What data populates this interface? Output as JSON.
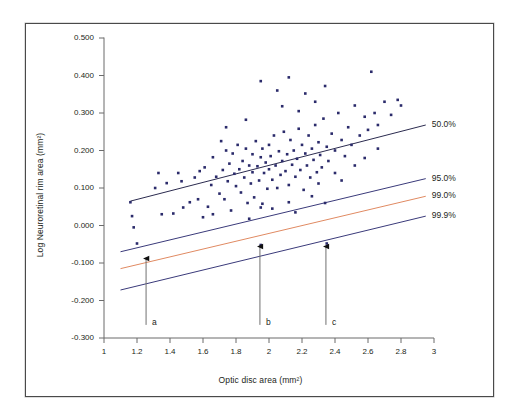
{
  "chart_data": {
    "type": "scatter",
    "title": "",
    "xlabel": "Optic disc area (mm²)",
    "ylabel": "Log Neuroretinal rim area (mm²)",
    "xlim": [
      1,
      3
    ],
    "ylim": [
      -0.3,
      0.5
    ],
    "xticks": [
      "1",
      "1.2",
      "1.4",
      "1.6",
      "1.8",
      "2",
      "2.2",
      "2.4",
      "2.6",
      "2.8",
      "3"
    ],
    "xtick_values": [
      1,
      1.2,
      1.4,
      1.6,
      1.8,
      2,
      2.2,
      2.4,
      2.6,
      2.8,
      3
    ],
    "yticks": [
      "0.500",
      "0.400",
      "0.300",
      "0.200",
      "0.100",
      "0.000",
      "-0.100",
      "-0.200",
      "-0.300"
    ],
    "ytick_values": [
      0.5,
      0.4,
      0.3,
      0.2,
      0.1,
      0.0,
      -0.1,
      -0.2,
      -0.3
    ],
    "grid": false,
    "legend": "none",
    "point_color": "#2b2b6b",
    "point_marker": "square",
    "series": [
      {
        "name": "Eyes",
        "color": "#2b2b6b",
        "points": [
          [
            1.16,
            0.062
          ],
          [
            1.17,
            0.025
          ],
          [
            1.18,
            -0.005
          ],
          [
            1.2,
            -0.048
          ],
          [
            1.31,
            0.1
          ],
          [
            1.33,
            0.14
          ],
          [
            1.35,
            0.03
          ],
          [
            1.38,
            0.113
          ],
          [
            1.42,
            0.032
          ],
          [
            1.45,
            0.14
          ],
          [
            1.47,
            0.118
          ],
          [
            1.52,
            0.062
          ],
          [
            1.55,
            0.128
          ],
          [
            1.57,
            0.07
          ],
          [
            1.58,
            0.145
          ],
          [
            1.61,
            0.155
          ],
          [
            1.63,
            0.05
          ],
          [
            1.65,
            0.108
          ],
          [
            1.66,
            0.182
          ],
          [
            1.68,
            0.13
          ],
          [
            1.7,
            0.085
          ],
          [
            1.71,
            0.225
          ],
          [
            1.72,
            0.148
          ],
          [
            1.73,
            0.07
          ],
          [
            1.74,
            0.2
          ],
          [
            1.75,
            0.118
          ],
          [
            1.76,
            0.165
          ],
          [
            1.77,
            0.04
          ],
          [
            1.78,
            0.192
          ],
          [
            1.79,
            0.138
          ],
          [
            1.8,
            0.105
          ],
          [
            1.81,
            0.215
          ],
          [
            1.82,
            0.15
          ],
          [
            1.83,
            0.088
          ],
          [
            1.84,
            0.172
          ],
          [
            1.85,
            0.128
          ],
          [
            1.86,
            0.205
          ],
          [
            1.87,
            0.06
          ],
          [
            1.88,
            0.16
          ],
          [
            1.89,
            0.112
          ],
          [
            1.9,
            0.19
          ],
          [
            1.9,
            0.142
          ],
          [
            1.91,
            0.075
          ],
          [
            1.92,
            0.225
          ],
          [
            1.93,
            0.158
          ],
          [
            1.94,
            0.12
          ],
          [
            1.95,
            0.182
          ],
          [
            1.95,
            0.048
          ],
          [
            1.96,
            0.205
          ],
          [
            1.97,
            0.14
          ],
          [
            1.98,
            0.168
          ],
          [
            1.99,
            0.098
          ],
          [
            2.0,
            0.215
          ],
          [
            2.0,
            0.15
          ],
          [
            2.01,
            0.185
          ],
          [
            2.02,
            0.122
          ],
          [
            2.03,
            0.24
          ],
          [
            2.04,
            0.16
          ],
          [
            2.05,
            0.1
          ],
          [
            2.06,
            0.198
          ],
          [
            2.07,
            0.135
          ],
          [
            2.08,
            0.172
          ],
          [
            2.09,
            0.25
          ],
          [
            2.1,
            0.145
          ],
          [
            2.11,
            0.19
          ],
          [
            2.12,
            0.108
          ],
          [
            2.13,
            0.228
          ],
          [
            2.14,
            0.162
          ],
          [
            2.15,
            0.2
          ],
          [
            2.16,
            0.13
          ],
          [
            2.17,
            0.178
          ],
          [
            2.18,
            0.258
          ],
          [
            2.19,
            0.148
          ],
          [
            2.2,
            0.215
          ],
          [
            2.21,
            0.095
          ],
          [
            2.22,
            0.192
          ],
          [
            2.23,
            0.16
          ],
          [
            2.24,
            0.24
          ],
          [
            2.25,
            0.128
          ],
          [
            2.26,
            0.205
          ],
          [
            2.27,
            0.175
          ],
          [
            2.28,
            0.268
          ],
          [
            2.29,
            0.142
          ],
          [
            2.3,
            0.222
          ],
          [
            2.31,
            0.188
          ],
          [
            2.32,
            0.155
          ],
          [
            2.33,
            0.285
          ],
          [
            2.35,
            0.21
          ],
          [
            2.36,
            0.172
          ],
          [
            2.38,
            0.245
          ],
          [
            2.4,
            0.2
          ],
          [
            2.42,
            0.3
          ],
          [
            2.44,
            0.228
          ],
          [
            2.46,
            0.185
          ],
          [
            2.48,
            0.262
          ],
          [
            2.5,
            0.215
          ],
          [
            2.52,
            0.32
          ],
          [
            2.55,
            0.24
          ],
          [
            2.58,
            0.29
          ],
          [
            2.6,
            0.255
          ],
          [
            2.62,
            0.41
          ],
          [
            2.64,
            0.3
          ],
          [
            2.66,
            0.268
          ],
          [
            2.7,
            0.33
          ],
          [
            2.74,
            0.295
          ],
          [
            2.78,
            0.335
          ],
          [
            2.8,
            0.32
          ],
          [
            1.95,
            0.385
          ],
          [
            2.05,
            0.36
          ],
          [
            2.12,
            0.395
          ],
          [
            2.22,
            0.352
          ],
          [
            2.28,
            0.33
          ],
          [
            2.34,
            0.372
          ],
          [
            2.08,
            0.318
          ],
          [
            2.18,
            0.305
          ],
          [
            1.86,
            0.282
          ],
          [
            1.74,
            0.262
          ],
          [
            2.26,
            0.078
          ],
          [
            2.34,
            0.06
          ],
          [
            2.12,
            0.062
          ],
          [
            1.96,
            0.058
          ],
          [
            1.6,
            0.022
          ],
          [
            1.48,
            0.048
          ],
          [
            1.95,
            -0.052
          ],
          [
            2.35,
            -0.048
          ],
          [
            2.3,
            0.112
          ],
          [
            2.4,
            0.14
          ],
          [
            2.44,
            0.12
          ],
          [
            2.52,
            0.16
          ],
          [
            2.58,
            0.18
          ],
          [
            2.66,
            0.205
          ],
          [
            1.66,
            0.03
          ],
          [
            1.88,
            0.018
          ],
          [
            2.02,
            0.045
          ],
          [
            2.16,
            0.035
          ]
        ]
      }
    ],
    "reference_lines": [
      {
        "label": "50.0%",
        "color": "#2b2b4f",
        "x0": 1.16,
        "y0": 0.065,
        "x1": 2.95,
        "y1": 0.268
      },
      {
        "label": "95.0%",
        "color": "#3a3a7a",
        "x0": 1.1,
        "y0": -0.07,
        "x1": 2.95,
        "y1": 0.125
      },
      {
        "label": "99.0%",
        "color": "#e08a62",
        "x0": 1.1,
        "y0": -0.115,
        "x1": 2.95,
        "y1": 0.078
      },
      {
        "label": "99.9%",
        "color": "#3a3a7a",
        "x0": 1.1,
        "y0": -0.172,
        "x1": 2.95,
        "y1": 0.025
      }
    ],
    "annotations": [
      {
        "label": "a",
        "x": 1.255,
        "y_tail": -0.265,
        "y_head": -0.072
      },
      {
        "label": "b",
        "x": 1.945,
        "y_tail": -0.265,
        "y_head": -0.04
      },
      {
        "label": "c",
        "x": 2.345,
        "y_tail": -0.265,
        "y_head": -0.04
      }
    ]
  }
}
